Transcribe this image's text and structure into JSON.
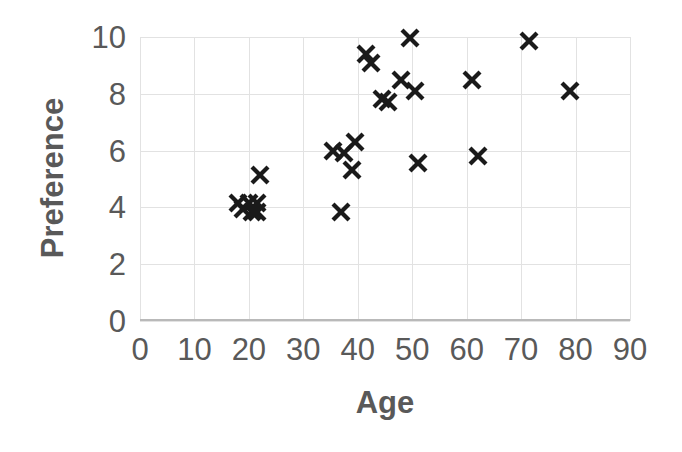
{
  "chart_data": {
    "type": "scatter",
    "title": "",
    "xlabel": "Age",
    "ylabel": "Preference",
    "xlim": [
      0,
      90
    ],
    "ylim": [
      0,
      10
    ],
    "xticks": [
      0,
      10,
      20,
      30,
      40,
      50,
      60,
      70,
      80,
      90
    ],
    "yticks": [
      0,
      2,
      4,
      6,
      8,
      10
    ],
    "grid": true,
    "legend": null,
    "marker": "x",
    "marker_color": "#1a1a1a",
    "grid_color": "#e2e2e2",
    "label_color": "#595959",
    "series": [
      {
        "name": "Preference vs Age",
        "points": [
          {
            "x": 18.0,
            "y": 4.15
          },
          {
            "x": 19.0,
            "y": 3.95
          },
          {
            "x": 20.0,
            "y": 4.15
          },
          {
            "x": 20.5,
            "y": 3.85
          },
          {
            "x": 21.5,
            "y": 4.15
          },
          {
            "x": 21.5,
            "y": 3.85
          },
          {
            "x": 22.0,
            "y": 5.15
          },
          {
            "x": 35.5,
            "y": 6.0
          },
          {
            "x": 37.0,
            "y": 3.85
          },
          {
            "x": 37.5,
            "y": 5.9
          },
          {
            "x": 39.5,
            "y": 6.3
          },
          {
            "x": 39.0,
            "y": 5.3
          },
          {
            "x": 41.5,
            "y": 9.4
          },
          {
            "x": 42.5,
            "y": 9.1
          },
          {
            "x": 44.5,
            "y": 7.8
          },
          {
            "x": 45.5,
            "y": 7.7
          },
          {
            "x": 48.0,
            "y": 8.5
          },
          {
            "x": 49.5,
            "y": 9.95
          },
          {
            "x": 50.5,
            "y": 8.1
          },
          {
            "x": 51.0,
            "y": 5.55
          },
          {
            "x": 61.0,
            "y": 8.5
          },
          {
            "x": 62.0,
            "y": 5.8
          },
          {
            "x": 71.5,
            "y": 9.85
          },
          {
            "x": 79.0,
            "y": 8.1
          }
        ]
      }
    ]
  }
}
